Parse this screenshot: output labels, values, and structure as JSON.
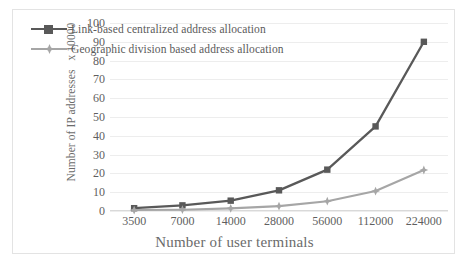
{
  "chart_data": {
    "type": "line",
    "title": "",
    "xlabel": "Number of user terminals",
    "ylabel": "Number of IP addresses   x 10000",
    "categories": [
      "3500",
      "7000",
      "14000",
      "28000",
      "56000",
      "112000",
      "224000"
    ],
    "ylim": [
      0,
      100
    ],
    "ytick_step": 10,
    "yticks": [
      "100",
      "90",
      "80",
      "70",
      "60",
      "50",
      "40",
      "30",
      "20",
      "10",
      "0"
    ],
    "grid": "horizontal",
    "legend_position": "inside-top-left",
    "series": [
      {
        "name": "Link-based centralized address allocation",
        "color": "#595959",
        "marker": "square",
        "values": [
          1.5,
          3,
          5.5,
          11,
          22,
          45,
          90
        ]
      },
      {
        "name": "Geographic division based address allocation",
        "color": "#a6a6a6",
        "marker": "star",
        "values": [
          0.5,
          0.7,
          1.4,
          2.6,
          5.2,
          10.6,
          21.8
        ]
      }
    ]
  },
  "colors": {
    "series_dark": "#595959",
    "series_light": "#a6a6a6",
    "gridline": "#ededed",
    "axis": "#d9d9d9",
    "text": "#5f5f5f",
    "frame_border": "#e3e3e3",
    "background": "#ffffff"
  }
}
